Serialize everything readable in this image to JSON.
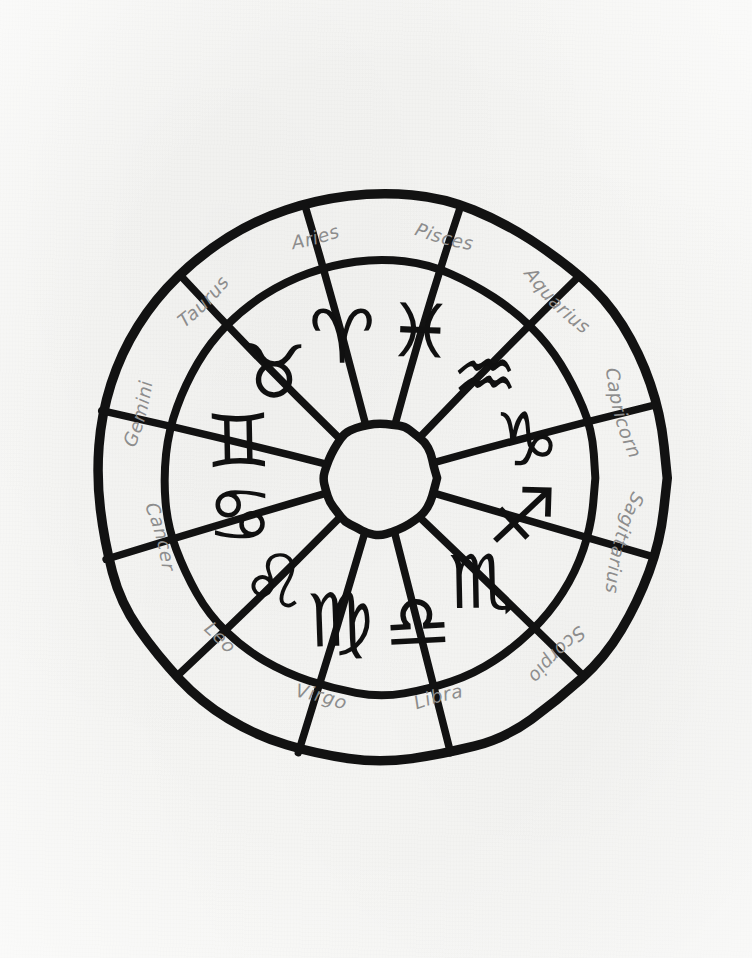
{
  "page": {
    "background_color": "#f5f5f3",
    "ink_color": "#121212",
    "label_color": "#8d8d8d",
    "medium": "hand-drawn ink on paper"
  },
  "wheel": {
    "center_x": 380,
    "center_y": 478,
    "outer_radius": 286,
    "inner_ring_radius": 217,
    "hub_radius": 56,
    "segment_count": 12,
    "segment_degrees": 30,
    "label_ring": "outer",
    "glyph_ring": "inner",
    "direction": "counter-clockwise from Pisces at top-right"
  },
  "signs": [
    {
      "id": "pisces",
      "label": "Pisces",
      "glyph": "♓",
      "angle": 75,
      "label_flip": false
    },
    {
      "id": "aquarius",
      "label": "Aquarius",
      "glyph": "♒",
      "angle": 45,
      "label_flip": false
    },
    {
      "id": "capricorn",
      "label": "Capricorn",
      "glyph": "♑",
      "angle": 15,
      "label_flip": false
    },
    {
      "id": "sagittarius",
      "label": "Sagittarius",
      "glyph": "♐",
      "angle": -15,
      "label_flip": false
    },
    {
      "id": "scorpio",
      "label": "Scorpio",
      "glyph": "♏",
      "angle": -45,
      "label_flip": false
    },
    {
      "id": "libra",
      "label": "Libra",
      "glyph": "♎",
      "angle": -75,
      "label_flip": true
    },
    {
      "id": "virgo",
      "label": "Virgo",
      "glyph": "♍",
      "angle": -105,
      "label_flip": true
    },
    {
      "id": "leo",
      "label": "Leo",
      "glyph": "♌",
      "angle": -135,
      "label_flip": true
    },
    {
      "id": "cancer",
      "label": "Cancer",
      "glyph": "♋",
      "angle": -165,
      "label_flip": true
    },
    {
      "id": "gemini",
      "label": "Gemini",
      "glyph": "♊",
      "angle": 165,
      "label_flip": false
    },
    {
      "id": "taurus",
      "label": "Taurus",
      "glyph": "♉",
      "angle": 135,
      "label_flip": false
    },
    {
      "id": "aries",
      "label": "Aries",
      "glyph": "♈",
      "angle": 105,
      "label_flip": false
    }
  ]
}
